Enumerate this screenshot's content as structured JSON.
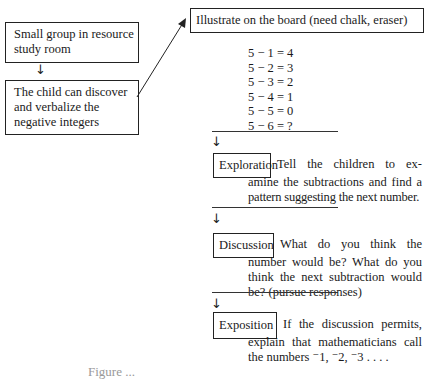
{
  "left_column": {
    "box1": {
      "lines": [
        "Small group in resource",
        "study room"
      ]
    },
    "arrow": "↓",
    "box2": {
      "lines": [
        "The child can discover",
        "and verbalize the",
        "negative integers"
      ]
    }
  },
  "right_column": {
    "header_box": "Illustrate on the board (need chalk, eraser)",
    "equations": [
      "5 − 1 = 4",
      "5 − 2 = 3",
      "5 − 3 = 2",
      "5 − 4 = 1",
      "5 − 5 = 0",
      "5 − 6 = ?"
    ],
    "steps": [
      {
        "label": "Exploration",
        "first_line": "Tell the children to ex-",
        "lines": [
          "amine the subtractions and find a",
          "pattern suggesting the next number."
        ]
      },
      {
        "label": "Discussion",
        "first_line": "What do you think the",
        "lines": [
          "number would be? What do you",
          "think the next subtraction would",
          "be? (pursue responses)"
        ]
      },
      {
        "label": "Exposition",
        "first_line": "If the discussion permits,",
        "lines": [
          "explain that mathematicians call",
          "the numbers ⁻1, ⁻2, ⁻3 . . . ."
        ]
      }
    ],
    "arrow": "↓"
  },
  "caption": "Figure ..."
}
